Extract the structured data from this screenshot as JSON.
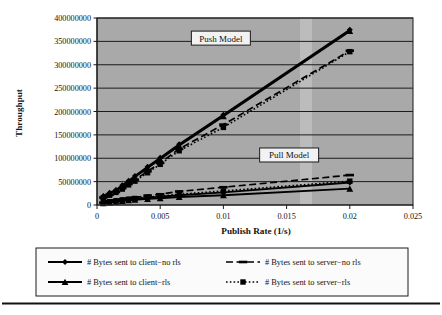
{
  "figure": {
    "background_color": "#ffffff",
    "plot_background_color": "#a9a9a9",
    "series_color": "#000000"
  },
  "annotations": [
    {
      "name": "push-model-label",
      "text": "Push Model",
      "x": 0.0098,
      "y": 357000000
    },
    {
      "name": "pull-model-label",
      "text": "Pull Model",
      "x": 0.0152,
      "y": 107000000
    }
  ],
  "legend": {
    "position": "bottom",
    "entries": [
      {
        "label": "# Bytes sent to client−no rls",
        "marker": "diamond",
        "dash": "solid"
      },
      {
        "label": "# Bytes sent to server−no rls",
        "marker": "dash-bar",
        "dash": "dashed"
      },
      {
        "label": "# Bytes sent to client−rls",
        "marker": "triangle",
        "dash": "solid"
      },
      {
        "label": "# Bytes sent to server−rls",
        "marker": "square",
        "dash": "dotted"
      }
    ]
  },
  "chart_data": {
    "type": "line",
    "title": "",
    "xlabel": "Publish Rate (1/s)",
    "ylabel": "Throughput",
    "xlim": [
      0,
      0.025
    ],
    "ylim": [
      0,
      400000000
    ],
    "xticks": [
      0,
      0.005,
      0.01,
      0.015,
      0.02,
      0.025
    ],
    "xtick_labels": [
      "0",
      "0.005",
      "0.01",
      "0.015",
      "0.02",
      "0.025"
    ],
    "yticks": [
      0,
      50000000,
      100000000,
      150000000,
      200000000,
      250000000,
      300000000,
      350000000,
      400000000
    ],
    "ytick_labels": [
      "0",
      "50000000",
      "100000000",
      "150000000",
      "200000000",
      "250000000",
      "300000000",
      "350000000",
      "400000000"
    ],
    "grid": "horizontal",
    "legend_position": "bottom",
    "series": [
      {
        "name": "# Bytes sent to client−no rls",
        "group": "Push Model",
        "marker": "diamond",
        "dash": "solid",
        "x": [
          0.0005,
          0.001,
          0.0015,
          0.002,
          0.0025,
          0.003,
          0.004,
          0.005,
          0.0065,
          0.01,
          0.02
        ],
        "y": [
          19000000,
          26000000,
          32000000,
          42000000,
          52000000,
          62000000,
          82000000,
          101000000,
          130000000,
          193000000,
          375000000
        ]
      },
      {
        "name": "# Bytes sent to client−rls",
        "group": "Push Model",
        "marker": "triangle",
        "dash": "solid",
        "x": [
          0.0005,
          0.001,
          0.0015,
          0.002,
          0.0025,
          0.003,
          0.004,
          0.005,
          0.0065,
          0.01,
          0.02
        ],
        "y": [
          18000000,
          25000000,
          31000000,
          40000000,
          50000000,
          60000000,
          79000000,
          98000000,
          127000000,
          190000000,
          372000000
        ]
      },
      {
        "name": "# Bytes sent to server−no rls",
        "group": "Push Model",
        "marker": "dash-bar",
        "dash": "dashed",
        "x": [
          0.0005,
          0.001,
          0.0015,
          0.002,
          0.0025,
          0.003,
          0.004,
          0.005,
          0.0065,
          0.01,
          0.02
        ],
        "y": [
          16000000,
          22000000,
          28000000,
          36000000,
          45000000,
          54000000,
          72000000,
          90000000,
          120000000,
          172000000,
          330000000
        ]
      },
      {
        "name": "# Bytes sent to server−rls",
        "group": "Push Model",
        "marker": "square",
        "dash": "dotted",
        "x": [
          0.0005,
          0.001,
          0.0015,
          0.002,
          0.0025,
          0.003,
          0.004,
          0.005,
          0.0065,
          0.01,
          0.02
        ],
        "y": [
          15000000,
          21000000,
          27000000,
          34000000,
          43000000,
          51000000,
          69000000,
          87000000,
          116000000,
          166000000,
          328000000
        ]
      },
      {
        "name": "# Bytes sent to server−no rls (pull)",
        "group": "Pull Model",
        "marker": "dash-bar",
        "dash": "dashed",
        "x": [
          0.0005,
          0.001,
          0.0015,
          0.002,
          0.0025,
          0.003,
          0.004,
          0.005,
          0.0065,
          0.01,
          0.02
        ],
        "y": [
          5000000,
          8000000,
          10000000,
          12000000,
          14000000,
          16000000,
          20000000,
          23000000,
          29000000,
          38000000,
          64000000
        ]
      },
      {
        "name": "# Bytes sent to server−rls (pull)",
        "group": "Pull Model",
        "marker": "square",
        "dash": "dotted",
        "x": [
          0.0005,
          0.001,
          0.0015,
          0.002,
          0.0025,
          0.003,
          0.004,
          0.005,
          0.0065,
          0.01,
          0.02
        ],
        "y": [
          4500000,
          7000000,
          9000000,
          11000000,
          12500000,
          14000000,
          17000000,
          19000000,
          23000000,
          30000000,
          51000000
        ]
      },
      {
        "name": "# Bytes sent to client−no rls (pull)",
        "group": "Pull Model",
        "marker": "diamond",
        "dash": "solid",
        "x": [
          0.0005,
          0.001,
          0.0015,
          0.002,
          0.0025,
          0.003,
          0.004,
          0.005,
          0.0065,
          0.01,
          0.02
        ],
        "y": [
          4000000,
          6500000,
          8500000,
          10000000,
          11500000,
          13000000,
          15500000,
          17500000,
          21000000,
          27000000,
          48000000
        ]
      },
      {
        "name": "# Bytes sent to client−rls (pull)",
        "group": "Pull Model",
        "marker": "triangle",
        "dash": "solid",
        "x": [
          0.0005,
          0.001,
          0.0015,
          0.002,
          0.0025,
          0.003,
          0.004,
          0.005,
          0.0065,
          0.01,
          0.02
        ],
        "y": [
          3500000,
          5500000,
          7000000,
          8500000,
          10000000,
          11000000,
          13000000,
          14500000,
          17000000,
          21000000,
          35000000
        ]
      }
    ]
  }
}
